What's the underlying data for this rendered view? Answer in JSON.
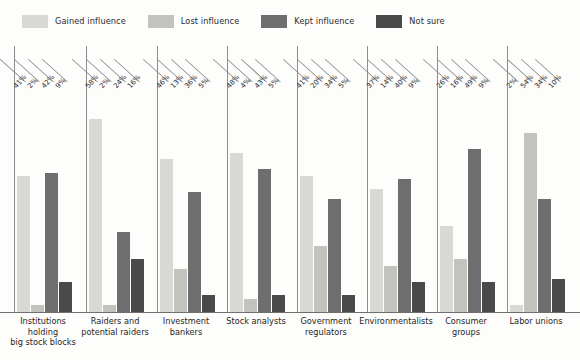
{
  "legend": {
    "items": [
      {
        "label": "Gained influence",
        "color": "#d8d8d4",
        "key": "gained"
      },
      {
        "label": "Lost influence",
        "color": "#c3c3be",
        "key": "lost"
      },
      {
        "label": "Kept influence",
        "color": "#6e6e6e",
        "key": "kept"
      },
      {
        "label": "Not sure",
        "color": "#4a4a4a",
        "key": "not_sure"
      }
    ]
  },
  "chart_data": {
    "type": "bar",
    "title": "",
    "xlabel": "",
    "ylabel": "",
    "ylim": [
      0,
      60
    ],
    "grid": false,
    "legend_position": "top-left",
    "value_suffix": "%",
    "categories": [
      "Institutions holding big stock blocks",
      "Raiders and potential raiders",
      "Investment bankers",
      "Stock analysts",
      "Government regulators",
      "Environmentalists",
      "Consumer groups",
      "Labor unions"
    ],
    "category_lines": [
      [
        "Institutions",
        "holding",
        "big stock blocks"
      ],
      [
        "Raiders and",
        "potential raiders"
      ],
      [
        "Investment",
        "bankers"
      ],
      [
        "Stock analysts"
      ],
      [
        "Government",
        "regulators"
      ],
      [
        "Environmentalists"
      ],
      [
        "Consumer",
        "groups"
      ],
      [
        "Labor unions"
      ]
    ],
    "series": [
      {
        "name": "Gained influence",
        "color": "#d8d8d4",
        "values": [
          41,
          58,
          46,
          48,
          41,
          37,
          26,
          2
        ]
      },
      {
        "name": "Lost influence",
        "color": "#c3c3be",
        "values": [
          2,
          2,
          13,
          4,
          20,
          14,
          16,
          54
        ]
      },
      {
        "name": "Kept influence",
        "color": "#6e6e6e",
        "values": [
          42,
          24,
          36,
          43,
          34,
          40,
          49,
          34
        ]
      },
      {
        "name": "Not sure",
        "color": "#4a4a4a",
        "values": [
          9,
          16,
          5,
          5,
          5,
          9,
          9,
          10
        ]
      }
    ],
    "labels": [
      [
        "41%",
        "2%",
        "42%",
        "9%"
      ],
      [
        "58%",
        "2%",
        "24%",
        "16%"
      ],
      [
        "46%",
        "13%",
        "36%",
        "5%"
      ],
      [
        "48%",
        "4%",
        "43%",
        "5%"
      ],
      [
        "41%",
        "20%",
        "34%",
        "5%"
      ],
      [
        "37%",
        "14%",
        "40%",
        "9%"
      ],
      [
        "26%",
        "16%",
        "49%",
        "9%"
      ],
      [
        "2%",
        "54%",
        "34%",
        "10%"
      ]
    ]
  }
}
